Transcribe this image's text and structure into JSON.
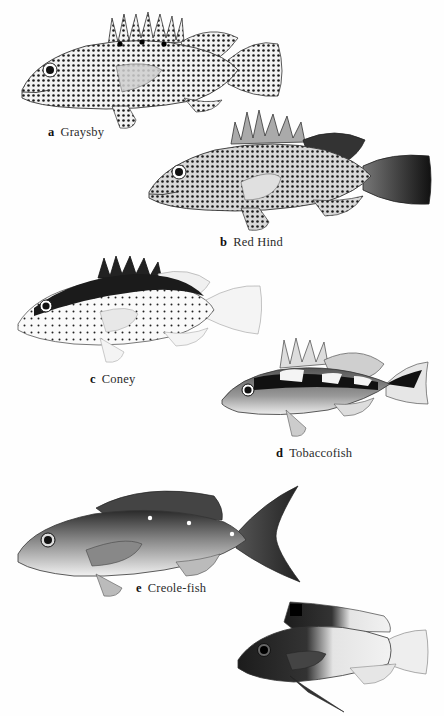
{
  "plate": {
    "background": "#ffffff",
    "ink_color": "#1a1a1a"
  },
  "figures": [
    {
      "letter": "a",
      "name": "Graysby",
      "pattern": "dense-spots"
    },
    {
      "letter": "b",
      "name": "Red Hind",
      "pattern": "dense-spots-dark-tail"
    },
    {
      "letter": "c",
      "name": "Coney",
      "pattern": "dark-dorsal-sparse-spots"
    },
    {
      "letter": "d",
      "name": "Tobaccofish",
      "pattern": "dark-lateral-band-saddles"
    },
    {
      "letter": "e",
      "name": "Creole-fish",
      "pattern": "dark-gradient-white-dots"
    },
    {
      "letter": "",
      "name": "",
      "pattern": "dark-front-pale-rear"
    }
  ]
}
